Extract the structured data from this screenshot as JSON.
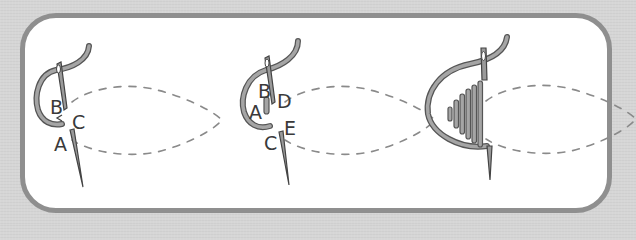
{
  "diagram": {
    "type": "embroidery-stitch-steps",
    "colors": {
      "background": "#d6d6d6",
      "frame_border": "#8f8f8f",
      "panel": "#ffffff",
      "thread": "#9a9a9a",
      "thread_outline": "#555555",
      "dashed_outline": "#8a8a8a",
      "label": "#3a3a3a"
    },
    "steps": [
      {
        "id": "step-1",
        "labels": {
          "a": "A",
          "b": "B",
          "c": "C"
        }
      },
      {
        "id": "step-2",
        "labels": {
          "a": "A",
          "b": "B",
          "c": "C",
          "d": "D",
          "e": "E"
        }
      },
      {
        "id": "step-3",
        "labels": {}
      }
    ]
  }
}
